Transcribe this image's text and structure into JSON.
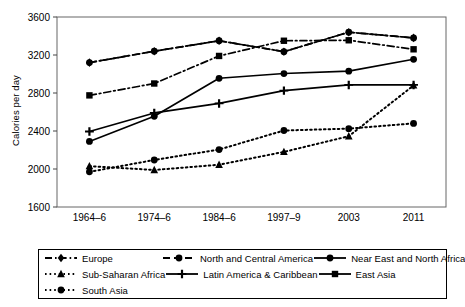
{
  "chart_data": {
    "type": "line",
    "title": "",
    "xlabel": "",
    "ylabel": "Calories per day",
    "categories": [
      "1964–6",
      "1974–6",
      "1984–6",
      "1997–9",
      "2003",
      "2011"
    ],
    "ylim": [
      1600,
      3600
    ],
    "yticks": [
      1600,
      2000,
      2400,
      2800,
      3200,
      3600
    ],
    "grid": false,
    "legend_position": "bottom",
    "series": [
      {
        "name": "Europe",
        "marker": "diamond",
        "line_style": "dashdot",
        "values": [
          3120,
          3240,
          3350,
          3235,
          3440,
          3380
        ]
      },
      {
        "name": "North and Central America",
        "marker": "circle",
        "line_style": "dashed",
        "values": [
          3120,
          3240,
          3350,
          3235,
          3440,
          3380
        ]
      },
      {
        "name": "Near East and North Africa",
        "marker": "circle",
        "line_style": "solid",
        "values": [
          2290,
          2555,
          2955,
          3005,
          3030,
          3155
        ]
      },
      {
        "name": "Sub-Saharan Africa",
        "marker": "triangle",
        "line_style": "dotted",
        "values": [
          2030,
          1990,
          2045,
          2180,
          2345,
          2880
        ]
      },
      {
        "name": "Latin America & Caribbean",
        "marker": "plus",
        "line_style": "solid",
        "values": [
          2395,
          2590,
          2690,
          2825,
          2885,
          2885
        ]
      },
      {
        "name": "East Asia",
        "marker": "square",
        "line_style": "dashdot",
        "values": [
          2775,
          2900,
          3190,
          3350,
          3355,
          3260
        ]
      },
      {
        "name": "South Asia",
        "marker": "circle",
        "line_style": "dotted",
        "values": [
          1970,
          2095,
          2205,
          2405,
          2425,
          2480
        ]
      }
    ]
  },
  "axis": {
    "y_title": "Calories per day",
    "y_ticks": [
      "3600",
      "3200",
      "2800",
      "2400",
      "2000",
      "1600"
    ],
    "x_ticks": [
      "1964–6",
      "1974–6",
      "1984–6",
      "1997–9",
      "2003",
      "2011"
    ]
  },
  "legend": {
    "rows": [
      [
        {
          "label": "Europe",
          "marker": "diamond",
          "style": "dashdot"
        },
        {
          "label": "North and Central America",
          "marker": "circle",
          "style": "dashed"
        },
        {
          "label": "Near East and North Africa",
          "marker": "circle",
          "style": "solid"
        }
      ],
      [
        {
          "label": "Sub-Saharan Africa",
          "marker": "triangle",
          "style": "dotted"
        },
        {
          "label": "Latin America & Caribbean",
          "marker": "plus",
          "style": "solid"
        },
        {
          "label": "East Asia",
          "marker": "square",
          "style": "solid"
        }
      ],
      [
        {
          "label": "South Asia",
          "marker": "circle",
          "style": "dotted"
        }
      ]
    ]
  },
  "colors": {
    "ink": "#000000",
    "background": "#ffffff",
    "axis": "#555555"
  }
}
